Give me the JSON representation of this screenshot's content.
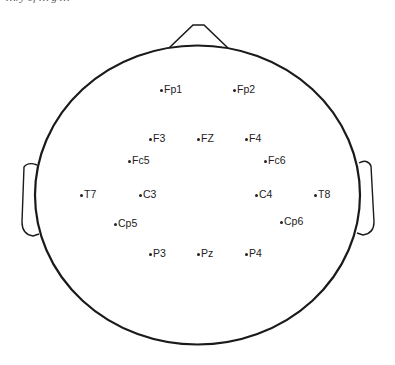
{
  "diagram": {
    "caption_cut": "…ry of … g …",
    "colors": {
      "outline": "#1a1a1a",
      "text": "#222222",
      "background": "#ffffff"
    },
    "head": {
      "cx": 197.5,
      "cy": 195,
      "rx": 162.5,
      "ry": 149.5
    },
    "electrodes": [
      {
        "id": "fp1",
        "label": "Fp1",
        "x": 160,
        "y": 89
      },
      {
        "id": "fp2",
        "label": "Fp2",
        "x": 233,
        "y": 89
      },
      {
        "id": "f3",
        "label": "F3",
        "x": 149,
        "y": 138
      },
      {
        "id": "fz",
        "label": "FZ",
        "x": 197,
        "y": 138
      },
      {
        "id": "f4",
        "label": "F4",
        "x": 245,
        "y": 138
      },
      {
        "id": "fc5",
        "label": "Fc5",
        "x": 128,
        "y": 160
      },
      {
        "id": "fc6",
        "label": "Fc6",
        "x": 264,
        "y": 160
      },
      {
        "id": "t7",
        "label": "T7",
        "x": 80,
        "y": 194
      },
      {
        "id": "c3",
        "label": "C3",
        "x": 139,
        "y": 194
      },
      {
        "id": "c4",
        "label": "C4",
        "x": 255,
        "y": 194
      },
      {
        "id": "t8",
        "label": "T8",
        "x": 314,
        "y": 194
      },
      {
        "id": "cp5",
        "label": "Cp5",
        "x": 114,
        "y": 223
      },
      {
        "id": "cp6",
        "label": "Cp6",
        "x": 280,
        "y": 221
      },
      {
        "id": "p3",
        "label": "P3",
        "x": 149,
        "y": 253
      },
      {
        "id": "pz",
        "label": "Pz",
        "x": 197,
        "y": 253
      },
      {
        "id": "p4",
        "label": "P4",
        "x": 245,
        "y": 253
      }
    ]
  }
}
